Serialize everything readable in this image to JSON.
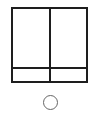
{
  "diagram": {
    "type": "grid-window-icon",
    "frame": {
      "columns": 2,
      "rows": 2,
      "stroke_color": "#1e1e1e"
    },
    "panes": [
      {
        "id": "top-left"
      },
      {
        "id": "top-right"
      },
      {
        "id": "bottom-left"
      },
      {
        "id": "bottom-right"
      }
    ],
    "radio": {
      "checked": false,
      "stroke_color": "#666666"
    }
  }
}
